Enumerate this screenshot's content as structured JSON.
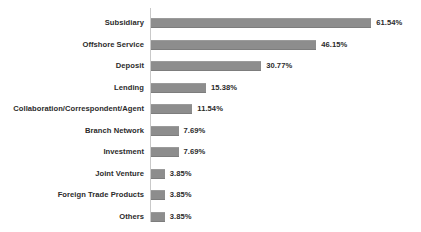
{
  "chart_data": {
    "type": "bar",
    "orientation": "horizontal",
    "title": "",
    "xlabel": "",
    "ylabel": "",
    "grid": false,
    "legend": false,
    "value_suffix": "%",
    "xlim": [
      0,
      65
    ],
    "categories": [
      "Subsidiary",
      "Offshore Service",
      "Deposit",
      "Lending",
      "Collaboration/Correspondent/Agent",
      "Branch Network",
      "Investment",
      "Joint Venture",
      "Foreign Trade Products",
      "Others"
    ],
    "values": [
      61.54,
      46.15,
      30.77,
      15.38,
      11.54,
      7.69,
      7.69,
      3.85,
      3.85,
      3.85
    ],
    "value_labels": [
      "61.54%",
      "46.15%",
      "30.77%",
      "15.38%",
      "11.54%",
      "7.69%",
      "7.69%",
      "3.85%",
      "3.85%",
      "3.85%"
    ],
    "bar_color": "#8d8d8d",
    "text_color": "#2b2b2b",
    "axis_color": "#c9c9c9",
    "background": "#ffffff"
  },
  "title_remnant": "",
  "rows": [
    {
      "label": "Subsidiary",
      "value": 61.54,
      "value_label": "61.54%"
    },
    {
      "label": "Offshore Service",
      "value": 46.15,
      "value_label": "46.15%"
    },
    {
      "label": "Deposit",
      "value": 30.77,
      "value_label": "30.77%"
    },
    {
      "label": "Lending",
      "value": 15.38,
      "value_label": "15.38%"
    },
    {
      "label": "Collaboration/Correspondent/Agent",
      "value": 11.54,
      "value_label": "11.54%"
    },
    {
      "label": "Branch Network",
      "value": 7.69,
      "value_label": "7.69%"
    },
    {
      "label": "Investment",
      "value": 7.69,
      "value_label": "7.69%"
    },
    {
      "label": "Joint Venture",
      "value": 3.85,
      "value_label": "3.85%"
    },
    {
      "label": "Foreign Trade Products",
      "value": 3.85,
      "value_label": "3.85%"
    },
    {
      "label": "Others",
      "value": 3.85,
      "value_label": "3.85%"
    }
  ],
  "layout": {
    "row_pitch": 21.5,
    "row_top": 4,
    "px_per_percent": 3.58
  }
}
